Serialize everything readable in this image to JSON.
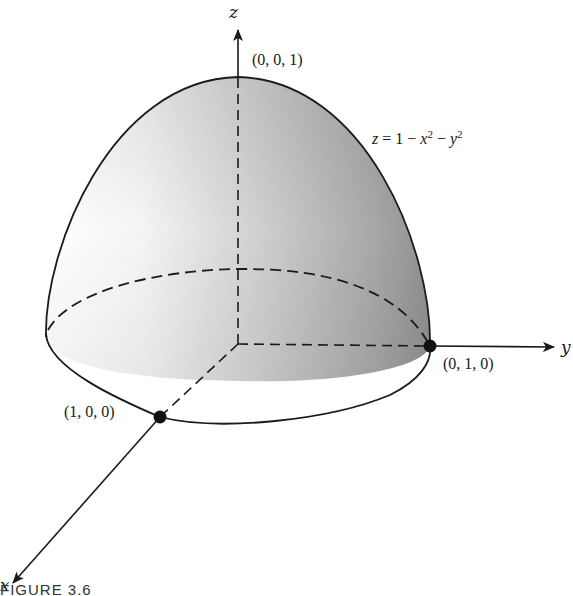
{
  "figure": {
    "caption": "FIGURE 3.6",
    "equation": {
      "lhs": "z",
      "eq": " = 1 − ",
      "x": "x",
      "x_exp": "2",
      "minus": " − ",
      "y": "y",
      "y_exp": "2",
      "full_text": "z = 1 − x² − y²"
    },
    "axes": {
      "x_label": "x",
      "y_label": "y",
      "z_label": "z"
    },
    "points": [
      {
        "id": "apex",
        "label": "(0, 0, 1)",
        "marked": false
      },
      {
        "id": "y-intercept",
        "label": "(0, 1, 0)",
        "marked": true
      },
      {
        "id": "x-intercept",
        "label": "(1, 0, 0)",
        "marked": true
      }
    ],
    "surface": {
      "type": "paraboloid",
      "description": "Paraboloid cap above the xy-plane, bounded by the unit circle",
      "shade_light": "#ffffff",
      "shade_dark": "#8c8c8c",
      "outline_color": "#1a1a1a"
    },
    "colors": {
      "ink": "#1a1a1a",
      "background": "#ffffff"
    }
  }
}
